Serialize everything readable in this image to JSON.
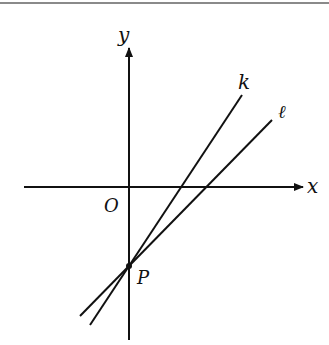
{
  "diagram": {
    "type": "coordinate-plane",
    "axes": {
      "x_label": "x",
      "y_label": "y",
      "origin_label": "O"
    },
    "point": {
      "label": "P",
      "location": "on negative y-axis, intersection of lines k and ℓ"
    },
    "lines": [
      {
        "label": "k",
        "description": "steeper line through P, positive slope"
      },
      {
        "label": "ℓ",
        "description": "less steep line through P, positive slope"
      }
    ],
    "colors": {
      "stroke": "#111111",
      "rule": "#8a8a8a",
      "background": "#ffffff"
    }
  }
}
